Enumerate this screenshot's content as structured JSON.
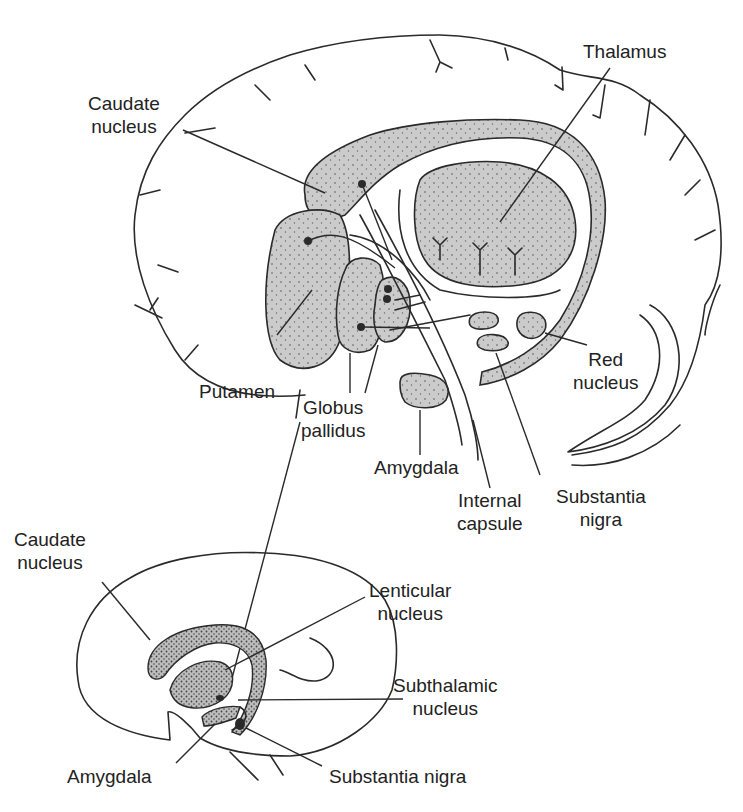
{
  "figure": {
    "fill_color": "#c8c8c8",
    "line_color": "#2a2a2a"
  },
  "top_view": {
    "labels": {
      "caudate_1": "Caudate",
      "caudate_2": "nucleus",
      "thalamus": "Thalamus",
      "putamen": "Putamen",
      "globus_1": "Globus",
      "globus_2": "pallidus",
      "amygdala": "Amygdala",
      "internal_1": "Internal",
      "internal_2": "capsule",
      "substantia_1": "Substantia",
      "substantia_2": "nigra",
      "red_1": "Red",
      "red_2": "nucleus"
    }
  },
  "bottom_view": {
    "labels": {
      "caudate_1": "Caudate",
      "caudate_2": "nucleus",
      "lenticular_1": "Lenticular",
      "lenticular_2": "nucleus",
      "subthalamic_1": "Subthalamic",
      "subthalamic_2": "nucleus",
      "amygdala": "Amygdala",
      "substantia": "Substantia nigra"
    }
  }
}
